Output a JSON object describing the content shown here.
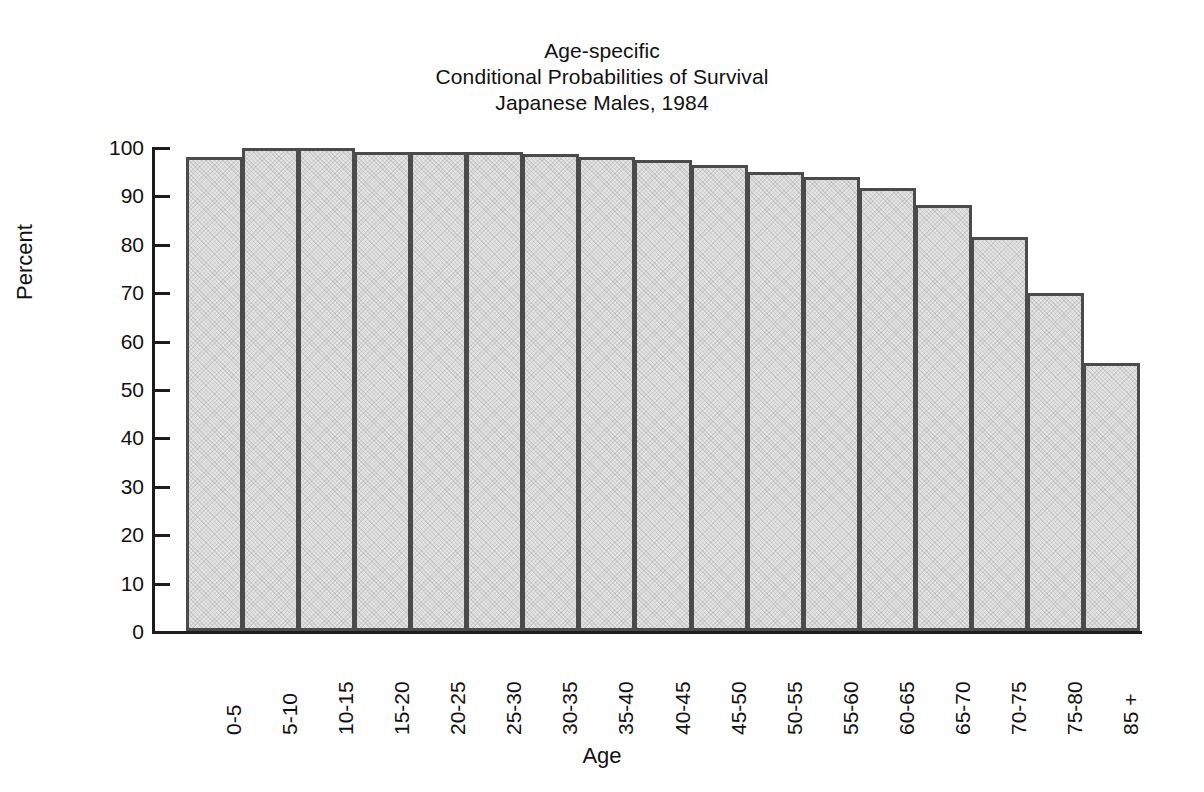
{
  "chart_data": {
    "type": "bar",
    "title": "Age-specific\nConditional Probabilities of Survival\nJapanese Males, 1984",
    "title_lines": [
      "Age-specific",
      "Conditional Probabilities of Survival",
      "Japanese Males, 1984"
    ],
    "xlabel": "Age",
    "ylabel": "Percent",
    "ylim": [
      0,
      100
    ],
    "ytick_labels": [
      "100",
      "90",
      "80",
      "70",
      "60",
      "50",
      "40",
      "30",
      "20",
      "10",
      "0"
    ],
    "ytick_values": [
      100,
      90,
      80,
      70,
      60,
      50,
      40,
      30,
      20,
      10,
      0
    ],
    "grid": false,
    "legend": null,
    "categories": [
      "0-5",
      "5-10",
      "10-15",
      "15-20",
      "20-25",
      "25-30",
      "30-35",
      "35-40",
      "40-45",
      "45-50",
      "50-55",
      "55-60",
      "60-65",
      "65-70",
      "70-75",
      "75-80",
      "85 +"
    ],
    "values": [
      98.0,
      99.7,
      99.7,
      99.0,
      99.0,
      99.0,
      98.5,
      98.0,
      97.3,
      96.2,
      94.8,
      93.8,
      91.6,
      88.1,
      81.4,
      69.8,
      55.4
    ],
    "bar_fill_color": "#e3e3e3",
    "bar_edge_color": "#4b4b4b",
    "axis_color": "#1c1c1c"
  }
}
